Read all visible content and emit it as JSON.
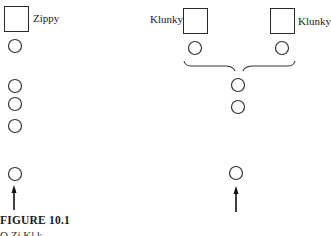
{
  "figure": {
    "caption": "FIGURE 10.1",
    "subcaption": "O    Zi            Kl    k"
  },
  "left_diagram": {
    "box_label": "Zippy",
    "circles": 5,
    "arrow": "up"
  },
  "right_diagram": {
    "box_labels": [
      "Klunky",
      "Klunky"
    ],
    "top_circles": 2,
    "merged_circles": 3,
    "connector": "brace",
    "arrow": "up"
  },
  "colors": {
    "stroke": "#2a2a2a",
    "background": "#ffffff"
  }
}
